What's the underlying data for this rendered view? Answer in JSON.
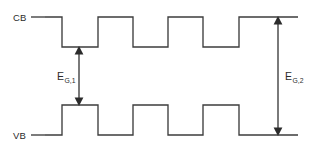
{
  "figure": {
    "kind": "semiconductor-band-diagram",
    "background_color": "#ffffff",
    "line_color": "#3d3d3d",
    "text_color": "#2b2b2b"
  },
  "labels": {
    "conduction_band": "CB",
    "valence_band": "VB",
    "gap_small_base": "E",
    "gap_small_sub": "G,1",
    "gap_large_base": "E",
    "gap_large_sub": "G,2"
  },
  "geometry": {
    "cb_high_y": 17,
    "cb_low_y": 47,
    "vb_high_y": 105,
    "vb_low_y": 135,
    "lead_cb": {
      "x1": 31,
      "x2": 45,
      "y": 17
    },
    "lead_vb": {
      "x1": 31,
      "x2": 45,
      "y": 135
    },
    "cb_points": "45,17 62,17 62,47 98,47 98,17 133,17 133,47 168,47 168,17 203,17 203,47 239,47 239,17 276,17 298,17",
    "vb_points": "45,135 62,135 62,105 98,105 98,135 133,135 133,105 168,105 168,135 203,135 203,105 239,105 239,135 276,135 298,135",
    "arrow_small": {
      "x": 79,
      "y_top": 47,
      "y_bottom": 105
    },
    "arrow_large": {
      "x": 278,
      "y_top": 17,
      "y_bottom": 135
    }
  },
  "annotations": {
    "cb_label_pos": {
      "x": 13,
      "y": 21
    },
    "vb_label_pos": {
      "x": 13,
      "y": 139
    },
    "gap_small_label_pos": {
      "x": 57,
      "y": 80
    },
    "gap_large_label_pos": {
      "x": 283,
      "y": 80
    }
  }
}
